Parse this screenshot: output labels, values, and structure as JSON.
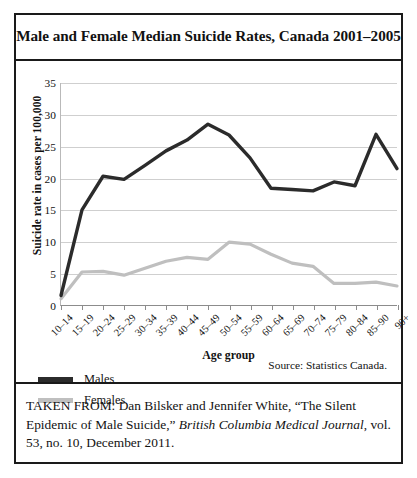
{
  "figure": {
    "title": "Male and Female Median Suicide Rates, Canada 2001–2005",
    "source_note": "Source: Statistics Canada.",
    "caption_prefix": "TAKEN FROM: Dan Bilsker and Jennifer White, “The Silent Epidemic of Male Suicide,” ",
    "caption_journal": "British Columbia Medical Journal",
    "caption_suffix": ", vol. 53, no. 10, December 2011."
  },
  "colors": {
    "males": "#2b2b2b",
    "females": "#bfbfbf",
    "gridline": "#cfcfcf",
    "axis": "#8c8c8c",
    "frame": "#1a1a1a"
  },
  "chart_data": {
    "type": "line",
    "title": "Male and Female Median Suicide Rates, Canada 2001–2005",
    "xlabel": "Age group",
    "ylabel": "Suicide rate in cases per 100,000",
    "ylim": [
      0,
      35
    ],
    "yticks": [
      0,
      5,
      10,
      15,
      20,
      25,
      30,
      35
    ],
    "grid": true,
    "legend_position": "below-left",
    "categories": [
      "10–14",
      "15–19",
      "20–24",
      "25–29",
      "30–34",
      "35–39",
      "40–44",
      "45–49",
      "50–54",
      "55–59",
      "60–64",
      "65–69",
      "70–74",
      "75–79",
      "80–84",
      "85–90",
      "90+"
    ],
    "series": [
      {
        "name": "Males",
        "color": "#2b2b2b",
        "values": [
          1.5,
          15.0,
          20.3,
          19.8,
          22.0,
          24.3,
          26.0,
          28.5,
          26.8,
          23.2,
          18.4,
          18.2,
          18.0,
          19.4,
          18.8,
          26.9,
          21.5
        ]
      },
      {
        "name": "Females",
        "color": "#bfbfbf",
        "values": [
          1.0,
          5.2,
          5.3,
          4.7,
          5.8,
          6.9,
          7.5,
          7.2,
          9.9,
          9.6,
          8.0,
          6.6,
          6.1,
          3.4,
          3.4,
          3.6,
          3.0
        ]
      }
    ]
  }
}
